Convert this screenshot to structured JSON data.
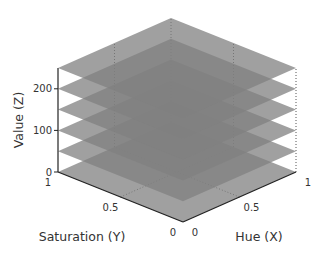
{
  "chart_data": {
    "type": "3d-planes",
    "title": "",
    "xlabel": "Hue (X)",
    "ylabel": "Saturation (Y)",
    "zlabel": "Value (Z)",
    "xlim": [
      0,
      1
    ],
    "ylim": [
      0,
      1
    ],
    "zlim": [
      0,
      250
    ],
    "xticks": [
      {
        "value": 0,
        "label": "0"
      },
      {
        "value": 0.5,
        "label": "0.5"
      },
      {
        "value": 1,
        "label": "1"
      }
    ],
    "yticks": [
      {
        "value": 0,
        "label": "0"
      },
      {
        "value": 0.5,
        "label": "0.5"
      },
      {
        "value": 1,
        "label": "1"
      }
    ],
    "zticks": [
      {
        "value": 0,
        "label": "0"
      },
      {
        "value": 100,
        "label": "100"
      },
      {
        "value": 200,
        "label": "200"
      }
    ],
    "planes": [
      {
        "z": 0,
        "color": "#808080",
        "opacity": 0.75
      },
      {
        "z": 50,
        "color": "#808080",
        "opacity": 0.75
      },
      {
        "z": 100,
        "color": "#808080",
        "opacity": 0.75
      },
      {
        "z": 150,
        "color": "#808080",
        "opacity": 0.75
      },
      {
        "z": 200,
        "color": "#808080",
        "opacity": 0.75
      },
      {
        "z": 250,
        "color": "#808080",
        "opacity": 0.75
      }
    ],
    "grid": true,
    "legend": "none"
  }
}
